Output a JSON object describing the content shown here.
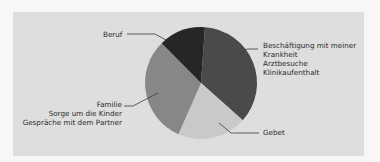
{
  "chart_data": {
    "type": "pie",
    "title": "",
    "start_angle_deg": 4,
    "direction": "clockwise",
    "slices": [
      {
        "label": "Beschäftigung mit meiner Krankheit",
        "sublabels": [
          "Arztbesuche",
          "Klinikaufenthalt"
        ],
        "value": 35.5,
        "color": "#4a4a4a"
      },
      {
        "label": "Gebet",
        "sublabels": [],
        "value": 20,
        "color": "#c9c9c9"
      },
      {
        "label": "Familie",
        "sublabels": [
          "Sorge um die Kinder",
          "Gespräche mit dem Partner"
        ],
        "value": 31,
        "color": "#878787"
      },
      {
        "label": "Beruf",
        "sublabels": [],
        "value": 13.5,
        "color": "#262626"
      }
    ],
    "legend": "none (leader-line labels)"
  },
  "labels": {
    "beruf": {
      "lines": [
        "Beruf"
      ]
    },
    "krankheit": {
      "lines": [
        "Beschäftigung mit meiner",
        "Krankheit",
        "Arztbesuche",
        "Klinikaufenthalt"
      ]
    },
    "familie": {
      "lines": [
        "Familie",
        "Sorge um die Kinder",
        "Gespräche mit dem Partner"
      ]
    },
    "gebet": {
      "lines": [
        "Gebet"
      ]
    }
  },
  "colors": {
    "panel": "#dedede",
    "background": "#f7f7f7",
    "leader": "#3a3a3a",
    "text": "#2a2a2a"
  }
}
